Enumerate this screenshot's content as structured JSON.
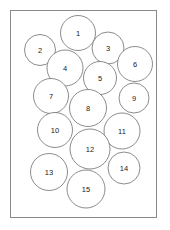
{
  "figure": {
    "name": "circle-packing-diagram",
    "frame": {
      "x": 10,
      "y": 10,
      "width": 147,
      "height": 208,
      "stroke_color": "#8a8a8a",
      "background_color": "#ffffff"
    },
    "circle_style": {
      "fill_color": "#ffffff",
      "stroke_color": "#6f6f6f",
      "label_color": "#1a1a1a"
    },
    "circle_count": 15,
    "circles": [
      {
        "label": "1",
        "cx": 78,
        "cy": 33,
        "r": 17.5
      },
      {
        "label": "2",
        "cx": 40,
        "cy": 50,
        "r": 15.5
      },
      {
        "label": "3",
        "cx": 108,
        "cy": 48,
        "r": 16.0
      },
      {
        "label": "4",
        "cx": 65,
        "cy": 68,
        "r": 18.0
      },
      {
        "label": "5",
        "cx": 100,
        "cy": 78,
        "r": 16.5
      },
      {
        "label": "6",
        "cx": 135,
        "cy": 64,
        "r": 17.5
      },
      {
        "label": "7",
        "cx": 51,
        "cy": 96,
        "r": 17.5
      },
      {
        "label": "8",
        "cx": 88,
        "cy": 108,
        "r": 18.5
      },
      {
        "label": "9",
        "cx": 134,
        "cy": 98,
        "r": 15.0
      },
      {
        "label": "10",
        "cx": 55,
        "cy": 130,
        "r": 17.5
      },
      {
        "label": "11",
        "cx": 122,
        "cy": 131,
        "r": 18.0
      },
      {
        "label": "12",
        "cx": 90,
        "cy": 149,
        "r": 20.0
      },
      {
        "label": "13",
        "cx": 49,
        "cy": 172,
        "r": 18.5
      },
      {
        "label": "14",
        "cx": 124,
        "cy": 168,
        "r": 16.0
      },
      {
        "label": "15",
        "cx": 86,
        "cy": 189,
        "r": 19.0
      }
    ]
  }
}
